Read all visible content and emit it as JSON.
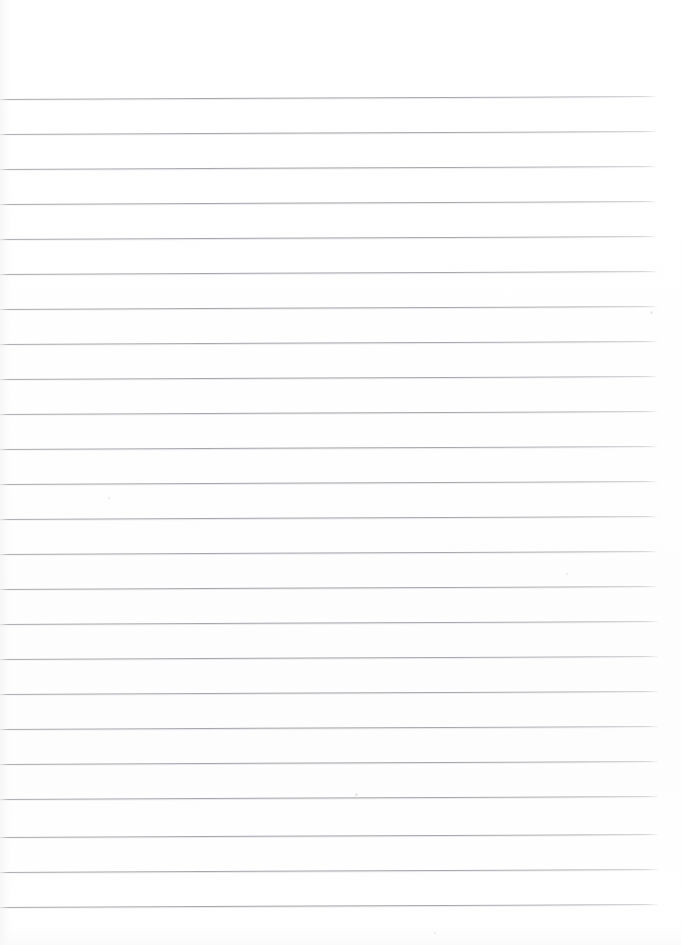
{
  "document": {
    "kind": "scanned-lined-paper",
    "title": "Blank Ruled Notebook Page",
    "orientation": "portrait",
    "page_width_px": 681,
    "page_height_px": 945,
    "background_color": "#ffffff",
    "has_text_content": false,
    "visible_text": "",
    "margin_note": "No writing, no header, no page number visible"
  },
  "ruling": {
    "line_color": "#9c9ca4",
    "line_thickness_px": 1,
    "line_count": 24,
    "line_spacing_px": 35,
    "first_line_y_px": 99,
    "last_line_y_px": 907,
    "line_start_x_px": 0,
    "line_end_x_px": 656,
    "skew_degrees": -0.26,
    "top_margin_px": 99,
    "bottom_margin_px": 38,
    "right_margin_px": 25,
    "left_margin_px": 0,
    "lines": [
      {
        "index": 1,
        "y": 99,
        "x_start": 0,
        "x_end": 656
      },
      {
        "index": 2,
        "y": 134,
        "x_start": 0,
        "x_end": 656
      },
      {
        "index": 3,
        "y": 169,
        "x_start": 0,
        "x_end": 656
      },
      {
        "index": 4,
        "y": 204,
        "x_start": 0,
        "x_end": 656
      },
      {
        "index": 5,
        "y": 239,
        "x_start": 0,
        "x_end": 656
      },
      {
        "index": 6,
        "y": 274,
        "x_start": 0,
        "x_end": 657
      },
      {
        "index": 7,
        "y": 309,
        "x_start": 0,
        "x_end": 657
      },
      {
        "index": 8,
        "y": 344,
        "x_start": 0,
        "x_end": 657
      },
      {
        "index": 9,
        "y": 379,
        "x_start": 0,
        "x_end": 657
      },
      {
        "index": 10,
        "y": 414,
        "x_start": 0,
        "x_end": 657
      },
      {
        "index": 11,
        "y": 449,
        "x_start": 0,
        "x_end": 657
      },
      {
        "index": 12,
        "y": 484,
        "x_start": 0,
        "x_end": 657
      },
      {
        "index": 13,
        "y": 519,
        "x_start": 0,
        "x_end": 657
      },
      {
        "index": 14,
        "y": 554,
        "x_start": 0,
        "x_end": 657
      },
      {
        "index": 15,
        "y": 589,
        "x_start": 0,
        "x_end": 657
      },
      {
        "index": 16,
        "y": 624,
        "x_start": 0,
        "x_end": 658
      },
      {
        "index": 17,
        "y": 659,
        "x_start": 0,
        "x_end": 658
      },
      {
        "index": 18,
        "y": 694,
        "x_start": 0,
        "x_end": 658
      },
      {
        "index": 19,
        "y": 729,
        "x_start": 0,
        "x_end": 658
      },
      {
        "index": 20,
        "y": 764,
        "x_start": 0,
        "x_end": 658
      },
      {
        "index": 21,
        "y": 799,
        "x_start": 0,
        "x_end": 658
      },
      {
        "index": 22,
        "y": 837,
        "x_start": 0,
        "x_end": 658
      },
      {
        "index": 23,
        "y": 872,
        "x_start": 0,
        "x_end": 658
      },
      {
        "index": 24,
        "y": 907,
        "x_start": 0,
        "x_end": 658
      }
    ]
  },
  "artifacts": {
    "specks": [
      {
        "x": 355,
        "y": 793,
        "size": 3
      },
      {
        "x": 650,
        "y": 311,
        "size": 3
      },
      {
        "x": 566,
        "y": 573,
        "size": 2
      },
      {
        "x": 108,
        "y": 497,
        "size": 2
      },
      {
        "x": 434,
        "y": 932,
        "size": 2
      }
    ]
  }
}
